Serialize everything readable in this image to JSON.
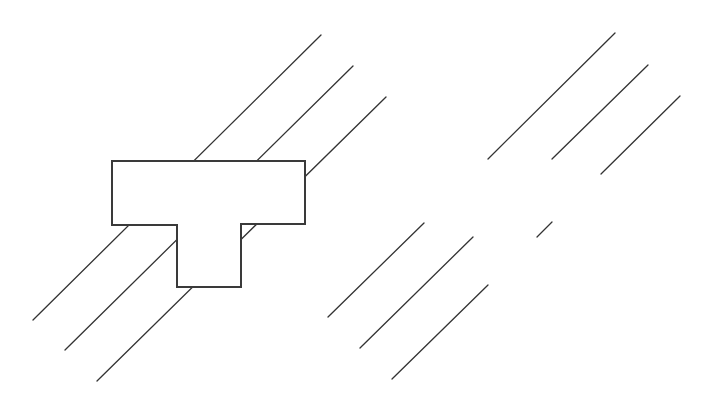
{
  "canvas": {
    "width": 708,
    "height": 409,
    "background": "#ffffff"
  },
  "style": {
    "line_color": "#333333",
    "line_width": 1.3,
    "shape_stroke": "#3a3a3a",
    "shape_stroke_width": 2,
    "shape_fill": "#ffffff"
  },
  "left_group": {
    "description": "T-shaped block placed over three parallel diagonal lines",
    "lines": [
      {
        "x1": 33,
        "y1": 320,
        "x2": 321,
        "y2": 35
      },
      {
        "x1": 65,
        "y1": 350,
        "x2": 353,
        "y2": 66
      },
      {
        "x1": 97,
        "y1": 381,
        "x2": 386,
        "y2": 97
      }
    ],
    "t_shape": {
      "points": [
        [
          112,
          161
        ],
        [
          305,
          161
        ],
        [
          305,
          224
        ],
        [
          241,
          224
        ],
        [
          241,
          287
        ],
        [
          177,
          287
        ],
        [
          177,
          225
        ],
        [
          112,
          225
        ]
      ]
    }
  },
  "right_group": {
    "description": "Parallel diagonal line segments with a T-shaped gap (block removed)",
    "lines": [
      {
        "x1": 488,
        "y1": 159,
        "x2": 615,
        "y2": 33
      },
      {
        "x1": 552,
        "y1": 159,
        "x2": 648,
        "y2": 65
      },
      {
        "x1": 601,
        "y1": 174,
        "x2": 680,
        "y2": 96
      },
      {
        "x1": 328,
        "y1": 317,
        "x2": 424,
        "y2": 223
      },
      {
        "x1": 360,
        "y1": 348,
        "x2": 473,
        "y2": 237
      },
      {
        "x1": 392,
        "y1": 379,
        "x2": 488,
        "y2": 285
      },
      {
        "x1": 537,
        "y1": 237,
        "x2": 552,
        "y2": 222
      }
    ]
  }
}
